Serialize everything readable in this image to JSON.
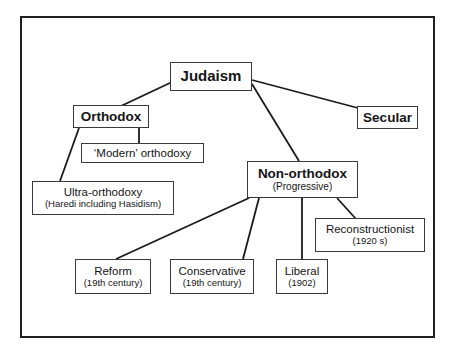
{
  "diagram": {
    "frame": {
      "stroke": "#231f20"
    },
    "nodes": {
      "judaism": {
        "title": "Judaism",
        "sub": ""
      },
      "orthodox": {
        "title": "Orthodox",
        "sub": ""
      },
      "secular": {
        "title": "Secular",
        "sub": ""
      },
      "modern_orthodoxy": {
        "title": "‘Modern’ orthodoxy",
        "sub": ""
      },
      "ultra_orthodoxy": {
        "title": "Ultra-orthodoxy",
        "sub": "(Haredi including Hasidism)"
      },
      "non_orthodox": {
        "title": "Non-orthodox",
        "sub": "(Progressive)"
      },
      "reconstructionist": {
        "title": "Reconstructionist",
        "sub": "(1920 s)"
      },
      "reform": {
        "title": "Reform",
        "sub": "(19th century)"
      },
      "conservative": {
        "title": "Conservative",
        "sub": "(19th century)"
      },
      "liberal": {
        "title": "Liberal",
        "sub": "(1902)"
      }
    },
    "edges": [
      {
        "from": "judaism",
        "to": "orthodox",
        "x1": 172,
        "y1": 82,
        "x2": 121,
        "y2": 106
      },
      {
        "from": "judaism",
        "to": "non_orthodox",
        "x1": 252,
        "y1": 84,
        "x2": 299,
        "y2": 161
      },
      {
        "from": "judaism",
        "to": "secular",
        "x1": 252,
        "y1": 80,
        "x2": 358,
        "y2": 108
      },
      {
        "from": "orthodox",
        "to": "modern_orthodoxy",
        "x1": 139,
        "y1": 128,
        "x2": 139,
        "y2": 143
      },
      {
        "from": "orthodox",
        "to": "ultra_orthodoxy",
        "x1": 79,
        "y1": 128,
        "x2": 60,
        "y2": 181
      },
      {
        "from": "non_orthodox",
        "to": "reform",
        "x1": 249,
        "y1": 198,
        "x2": 116,
        "y2": 259
      },
      {
        "from": "non_orthodox",
        "to": "conservative",
        "x1": 259,
        "y1": 198,
        "x2": 243,
        "y2": 259
      },
      {
        "from": "non_orthodox",
        "to": "liberal",
        "x1": 302,
        "y1": 198,
        "x2": 302,
        "y2": 259
      },
      {
        "from": "non_orthodox",
        "to": "reconstructionist",
        "x1": 337,
        "y1": 198,
        "x2": 356,
        "y2": 219
      }
    ],
    "edge_color": "#1b1b1b"
  }
}
